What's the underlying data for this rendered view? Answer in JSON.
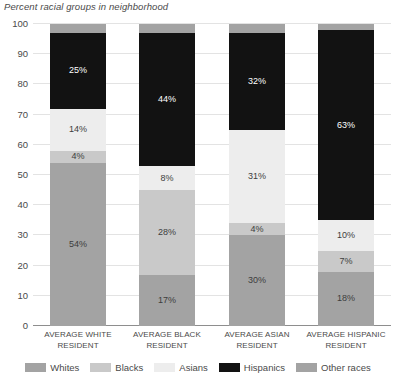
{
  "chart_data": {
    "type": "bar",
    "subtype": "stacked-bar-100",
    "title": "Percent racial groups in neighborhood",
    "xlabel": "",
    "ylabel": "",
    "ylim": [
      0,
      100
    ],
    "ytick_labels": [
      "0",
      "10",
      "20",
      "30",
      "40",
      "50",
      "60",
      "70",
      "80",
      "90",
      "100"
    ],
    "ytick_values": [
      0,
      10,
      20,
      30,
      40,
      50,
      60,
      70,
      80,
      90,
      100
    ],
    "grid": true,
    "legend_position": "bottom",
    "categories": [
      "AVERAGE WHITE RESIDENT",
      "AVERAGE BLACK RESIDENT",
      "AVERAGE ASIAN RESIDENT",
      "AVERAGE HISPANIC RESIDENT"
    ],
    "series": [
      {
        "name": "Whites",
        "color": "#a3a3a3",
        "label_color": "#3d3d3d",
        "values": [
          54,
          17,
          30,
          18
        ],
        "data_labels": [
          "54%",
          "17%",
          "30%",
          "18%"
        ]
      },
      {
        "name": "Blacks",
        "color": "#c9c9c9",
        "label_color": "#3d3d3d",
        "values": [
          4,
          28,
          4,
          7
        ],
        "data_labels": [
          "4%",
          "28%",
          "4%",
          "7%"
        ]
      },
      {
        "name": "Asians",
        "color": "#ededed",
        "label_color": "#3d3d3d",
        "values": [
          14,
          8,
          31,
          10
        ],
        "data_labels": [
          "14%",
          "8%",
          "31%",
          "10%"
        ]
      },
      {
        "name": "Hispanics",
        "color": "#121212",
        "label_color": "#ffffff",
        "values": [
          25,
          44,
          32,
          63
        ],
        "data_labels": [
          "25%",
          "44%",
          "32%",
          "63%"
        ]
      },
      {
        "name": "Other races",
        "color": "#a3a3a3",
        "label_color": "#3d3d3d",
        "values": [
          3,
          3,
          3,
          2
        ],
        "data_labels": [
          "",
          "",
          "",
          ""
        ]
      }
    ]
  },
  "legend": {
    "items": [
      {
        "label": "Whites",
        "color": "#a3a3a3"
      },
      {
        "label": "Blacks",
        "color": "#c9c9c9"
      },
      {
        "label": "Asians",
        "color": "#ededed"
      },
      {
        "label": "Hispanics",
        "color": "#121212"
      },
      {
        "label": "Other races",
        "color": "#a3a3a3"
      }
    ]
  }
}
